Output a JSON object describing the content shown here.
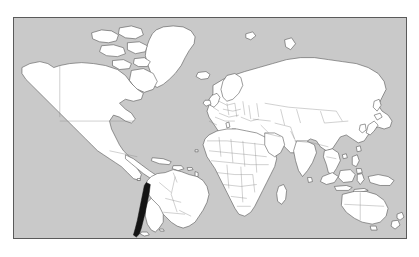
{
  "map": {
    "title": "World Map",
    "projection": "mercator",
    "panel": {
      "x": 13,
      "y": 17,
      "width": 394,
      "height": 222,
      "border_color": "#5a5a5a",
      "background_color": "#ffffff"
    },
    "colors": {
      "ocean": "#c9c9c9",
      "land": "#ffffff",
      "coastline": "#4a4a4a",
      "country_border": "#8a8a8a",
      "highlight": "#141414"
    },
    "legend_present": false,
    "labels_present": false,
    "graticule_present": false,
    "highlighted_countries": [
      "Chile"
    ],
    "regions": [
      "North America",
      "Greenland",
      "South America",
      "Europe",
      "Africa",
      "Asia",
      "Oceania"
    ],
    "notable_features": [
      "Alaska",
      "Canada",
      "United States",
      "Mexico",
      "Caribbean islands",
      "Brazil",
      "Chile",
      "Argentina",
      "Iceland",
      "British Isles",
      "Scandinavia",
      "Mediterranean Sea",
      "Madagascar",
      "Arabian Peninsula",
      "India",
      "Sri Lanka",
      "China",
      "Japan",
      "Korean Peninsula",
      "Indonesia",
      "Philippines",
      "Papua New Guinea",
      "Australia",
      "New Zealand",
      "Russia",
      "Canadian Arctic Archipelago"
    ]
  }
}
